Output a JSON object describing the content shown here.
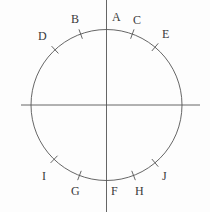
{
  "figure": {
    "background_color": "#fdfdfd",
    "stroke_color": "#555555",
    "label_color": "#3a3a3a",
    "circle": {
      "cx": 106.5,
      "cy": 105,
      "r": 75.5
    },
    "vertical_axis": {
      "x": 106.5,
      "y1": 0,
      "y2": 212
    },
    "horizontal_axis": {
      "y": 105,
      "x1": 21,
      "x2": 200
    }
  },
  "chart_data": {
    "type": "scatter",
    "title": "",
    "xlabel": "",
    "ylabel": "",
    "grid": false,
    "legend": null,
    "center": {
      "x": 106.5,
      "y": 105
    },
    "radius": 75.5,
    "points": [
      {
        "name": "A",
        "angle_deg": 90,
        "has_tick": false,
        "label_x": 112,
        "label_y": 11
      },
      {
        "name": "B",
        "angle_deg": 110,
        "has_tick": true,
        "label_x": 71,
        "label_y": 13
      },
      {
        "name": "C",
        "angle_deg": 70,
        "has_tick": true,
        "label_x": 133,
        "label_y": 14
      },
      {
        "name": "D",
        "angle_deg": 133,
        "has_tick": true,
        "label_x": 38,
        "label_y": 30
      },
      {
        "name": "E",
        "angle_deg": 50,
        "has_tick": true,
        "label_x": 162,
        "label_y": 28
      },
      {
        "name": "F",
        "angle_deg": 270,
        "has_tick": false,
        "label_x": 111,
        "label_y": 185
      },
      {
        "name": "G",
        "angle_deg": 249,
        "has_tick": true,
        "label_x": 71,
        "label_y": 185
      },
      {
        "name": "H",
        "angle_deg": 291,
        "has_tick": true,
        "label_x": 135,
        "label_y": 185
      },
      {
        "name": "I",
        "angle_deg": 226,
        "has_tick": true,
        "label_x": 42,
        "label_y": 170
      },
      {
        "name": "J",
        "angle_deg": 310,
        "has_tick": true,
        "label_x": 162,
        "label_y": 170
      }
    ],
    "labels": [
      "A",
      "B",
      "C",
      "D",
      "E",
      "F",
      "G",
      "H",
      "I",
      "J"
    ]
  }
}
